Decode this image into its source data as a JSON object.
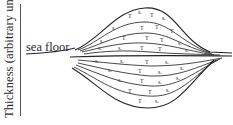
{
  "diagram": {
    "type": "geological-cross-section",
    "axis": {
      "y_label": "Thickness (arbitrary units)",
      "orientation": "vertical",
      "ticks": []
    },
    "labels": {
      "sea_floor": "sea floor"
    },
    "symbols": {
      "pattern_a": "T",
      "pattern_b": "s."
    },
    "layer_count_upper": 5,
    "layer_count_lower": 5,
    "colors": {
      "ink": "#222222",
      "background": "#ffffff"
    }
  }
}
